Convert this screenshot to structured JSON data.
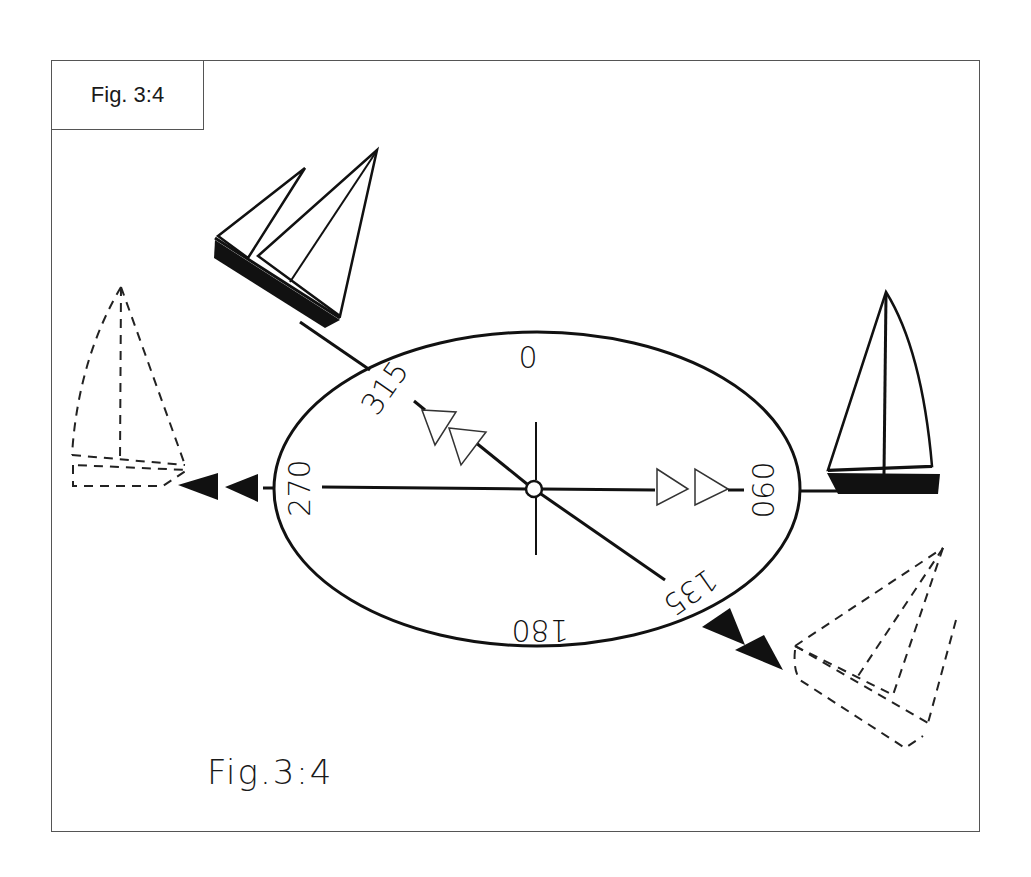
{
  "figure": {
    "corner_label": "Fig. 3:4",
    "bottom_caption": "Fig.3:4"
  },
  "compass": {
    "labels": {
      "north": "0",
      "east": "090",
      "south": "180",
      "west": "270",
      "northwest": "315",
      "southeast": "135"
    }
  },
  "boats": [
    {
      "id": "boat-northwest",
      "style": "solid",
      "heading": "315",
      "sails": 2
    },
    {
      "id": "boat-east",
      "style": "solid",
      "heading": "090",
      "sails": 1
    },
    {
      "id": "boat-west",
      "style": "dashed",
      "heading": "270",
      "sails": 1
    },
    {
      "id": "boat-southeast",
      "style": "dashed",
      "heading": "135",
      "sails": 2
    }
  ],
  "arrows": [
    {
      "id": "arrows-to-315",
      "fill": "open",
      "count": 2
    },
    {
      "id": "arrows-to-090",
      "fill": "open",
      "count": 2
    },
    {
      "id": "arrows-to-270",
      "fill": "solid",
      "count": 2
    },
    {
      "id": "arrows-to-135",
      "fill": "solid",
      "count": 2
    }
  ],
  "colors": {
    "ink": "#111111",
    "frame": "#555555",
    "background": "#ffffff"
  }
}
